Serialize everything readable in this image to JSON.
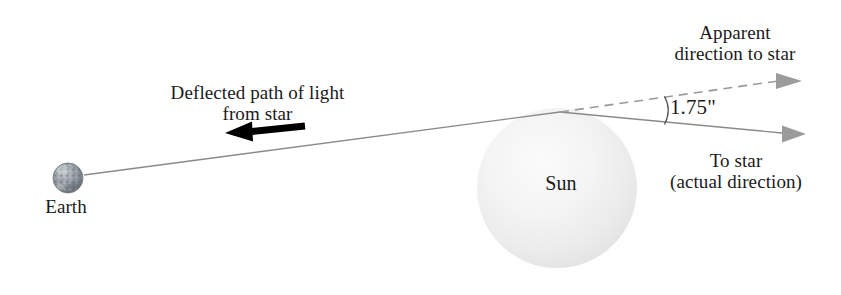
{
  "figure": {
    "type": "astronomy-diagram",
    "background_color": "#ffffff"
  },
  "labels": {
    "earth": "Earth",
    "sun": "Sun",
    "deflected_path_line1": "Deflected path of light",
    "deflected_path_line2": "from star",
    "apparent_line1": "Apparent",
    "apparent_line2": "direction to star",
    "to_star_line1": "To star",
    "to_star_line2": "(actual direction)",
    "deflection_angle": "1.75\""
  },
  "colors": {
    "line_gray": "#8a8a8a",
    "dashed_gray": "#9a9a9a",
    "arrow_black": "#000000",
    "arrowhead_gray": "#9b9b9b",
    "text": "#1a1a1a",
    "sun_fill_center": "#f7f7f7",
    "sun_fill_edge": "#e6e6e6",
    "earth_fill": "#9aa0a6"
  },
  "geometry": {
    "earth_center": {
      "x": 68,
      "y": 178
    },
    "earth_radius": 15,
    "sun_center": {
      "x": 557,
      "y": 188
    },
    "sun_radius": 80,
    "vertex": {
      "x": 560,
      "y": 112
    },
    "deflected_path_start": {
      "x": 84,
      "y": 175
    },
    "apparent_arrow_tip": {
      "x": 800,
      "y": 80
    },
    "actual_arrow_tip": {
      "x": 800,
      "y": 134
    },
    "black_arrow_tip": {
      "x": 228,
      "y": 132
    },
    "black_arrow_tail": {
      "x": 302,
      "y": 125
    },
    "angle_arc_x": 662
  },
  "elements": {
    "apparent_ray_style": "dashed",
    "actual_ray_style": "solid",
    "deflected_ray_style": "solid"
  }
}
